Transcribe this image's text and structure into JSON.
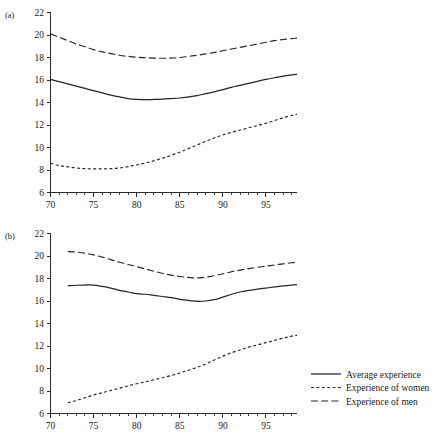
{
  "figure": {
    "background": "#ffffff",
    "ink_color": "#262626"
  },
  "legend": {
    "position": "bottom-right",
    "items": [
      {
        "label": "Average experience",
        "style": "solid"
      },
      {
        "label": "Experience of women",
        "style": "dotted"
      },
      {
        "label": "Experience of men",
        "style": "dashed"
      }
    ]
  },
  "panels": [
    {
      "key": "a",
      "label": "(a)"
    },
    {
      "key": "b",
      "label": "(b)"
    }
  ],
  "chart_data": [
    {
      "type": "line",
      "title": "",
      "panel": "(a)",
      "xlabel": "",
      "ylabel": "",
      "xlim": [
        70,
        98.6
      ],
      "ylim": [
        6,
        22
      ],
      "xticks": [
        70,
        75,
        80,
        85,
        90,
        95
      ],
      "xtick_labels": [
        "70",
        "75",
        "80",
        "85",
        "90",
        "95"
      ],
      "minor_xtick_step": 1,
      "yticks": [
        6,
        8,
        10,
        12,
        14,
        16,
        18,
        20,
        22
      ],
      "ytick_labels": [
        "6",
        "8",
        "10",
        "12",
        "14",
        "16",
        "18",
        "20",
        "22"
      ],
      "grid": false,
      "legend_position": "none",
      "x": [
        70,
        71,
        72,
        73,
        74,
        75,
        76,
        77,
        78,
        79,
        80,
        81,
        82,
        83,
        84,
        85,
        86,
        87,
        88,
        89,
        90,
        91,
        92,
        93,
        94,
        95,
        96,
        97,
        98,
        98.6
      ],
      "series": [
        {
          "name": "Average experience",
          "style": "solid",
          "values": [
            16.05,
            15.85,
            15.65,
            15.45,
            15.25,
            15.05,
            14.85,
            14.65,
            14.5,
            14.35,
            14.28,
            14.25,
            14.27,
            14.3,
            14.35,
            14.4,
            14.5,
            14.62,
            14.78,
            14.95,
            15.15,
            15.35,
            15.52,
            15.7,
            15.88,
            16.05,
            16.2,
            16.35,
            16.45,
            16.5
          ]
        },
        {
          "name": "Experience of women",
          "style": "dotted",
          "values": [
            8.6,
            8.4,
            8.28,
            8.18,
            8.12,
            8.1,
            8.1,
            8.12,
            8.18,
            8.3,
            8.45,
            8.62,
            8.82,
            9.05,
            9.3,
            9.58,
            9.9,
            10.22,
            10.55,
            10.85,
            11.12,
            11.35,
            11.55,
            11.75,
            11.95,
            12.15,
            12.4,
            12.65,
            12.85,
            12.95
          ]
        },
        {
          "name": "Experience of men",
          "style": "dashed",
          "values": [
            20.1,
            19.8,
            19.5,
            19.2,
            18.95,
            18.7,
            18.5,
            18.35,
            18.2,
            18.1,
            18.02,
            17.98,
            17.95,
            17.93,
            17.95,
            18.0,
            18.1,
            18.2,
            18.32,
            18.45,
            18.6,
            18.75,
            18.9,
            19.05,
            19.2,
            19.35,
            19.5,
            19.6,
            19.68,
            19.72
          ]
        }
      ]
    },
    {
      "type": "line",
      "title": "",
      "panel": "(b)",
      "xlabel": "",
      "ylabel": "",
      "xlim": [
        70,
        98.6
      ],
      "ylim": [
        6,
        22
      ],
      "xticks": [
        70,
        75,
        80,
        85,
        90,
        95
      ],
      "xtick_labels": [
        "70",
        "75",
        "80",
        "85",
        "90",
        "95"
      ],
      "minor_xtick_step": 1,
      "yticks": [
        6,
        8,
        10,
        12,
        14,
        16,
        18,
        20,
        22
      ],
      "ytick_labels": [
        "6",
        "8",
        "10",
        "12",
        "14",
        "16",
        "18",
        "20",
        "22"
      ],
      "grid": false,
      "legend_position": "right",
      "x": [
        72,
        73,
        74,
        75,
        76,
        77,
        78,
        79,
        80,
        81,
        82,
        83,
        84,
        85,
        86,
        87,
        88,
        89,
        90,
        91,
        92,
        93,
        94,
        95,
        96,
        97,
        98,
        98.6
      ],
      "series": [
        {
          "name": "Average experience",
          "style": "solid",
          "values": [
            17.35,
            17.4,
            17.42,
            17.42,
            17.3,
            17.15,
            16.95,
            16.8,
            16.65,
            16.6,
            16.5,
            16.4,
            16.3,
            16.15,
            16.05,
            15.98,
            16.0,
            16.12,
            16.35,
            16.6,
            16.8,
            16.95,
            17.05,
            17.15,
            17.25,
            17.35,
            17.42,
            17.45
          ]
        },
        {
          "name": "Experience of women",
          "style": "dotted",
          "values": [
            6.95,
            7.15,
            7.4,
            7.65,
            7.85,
            8.05,
            8.25,
            8.45,
            8.65,
            8.82,
            9.0,
            9.18,
            9.38,
            9.6,
            9.85,
            10.1,
            10.4,
            10.75,
            11.1,
            11.4,
            11.65,
            11.9,
            12.1,
            12.3,
            12.5,
            12.7,
            12.88,
            12.95
          ]
        },
        {
          "name": "Experience of men",
          "style": "dashed",
          "values": [
            20.4,
            20.35,
            20.25,
            20.1,
            19.9,
            19.68,
            19.45,
            19.25,
            19.05,
            18.85,
            18.65,
            18.45,
            18.3,
            18.18,
            18.1,
            18.05,
            18.12,
            18.25,
            18.42,
            18.6,
            18.75,
            18.88,
            19.0,
            19.1,
            19.2,
            19.3,
            19.4,
            19.45
          ]
        }
      ]
    }
  ]
}
